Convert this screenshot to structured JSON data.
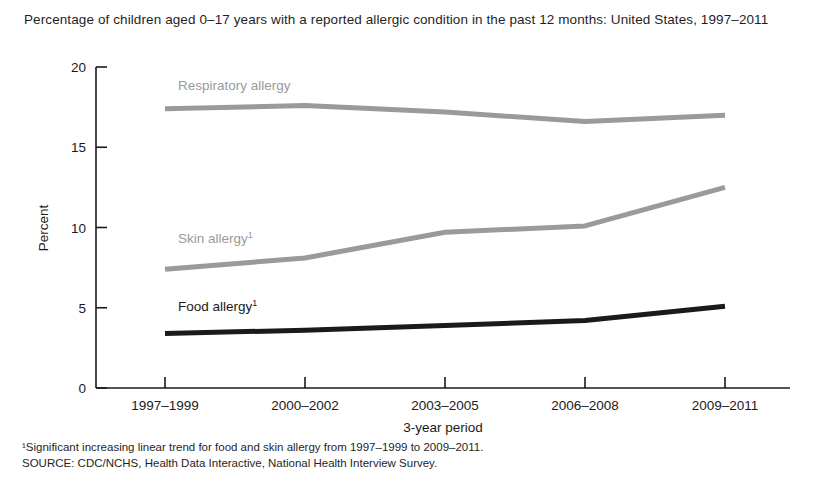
{
  "chart_data": {
    "type": "line",
    "title": "Percentage of children aged 0–17 years with a reported allergic condition in the past 12 months: United States, 1997–2011",
    "xlabel": "3-year period",
    "ylabel": "Percent",
    "categories": [
      "1997–1999",
      "2000–2002",
      "2003–2005",
      "2006–2008",
      "2009–2011"
    ],
    "ylim": [
      0,
      20
    ],
    "yticks": [
      0,
      5,
      10,
      15,
      20
    ],
    "grid": false,
    "legend_position": "inline-labels",
    "series": [
      {
        "name": "Respiratory allergy",
        "label": "Respiratory allergy",
        "footnote_marker": "",
        "color": "#9a9a9a",
        "values": [
          17.4,
          17.6,
          17.2,
          16.6,
          17.0
        ],
        "label_x": 1997,
        "label_y": 18.8
      },
      {
        "name": "Skin allergy",
        "label": "Skin allergy",
        "footnote_marker": "1",
        "color": "#9a9a9a",
        "values": [
          7.4,
          8.1,
          9.7,
          10.1,
          12.5
        ],
        "label_x": 1997,
        "label_y": 9.9
      },
      {
        "name": "Food allergy",
        "label": "Food allergy",
        "footnote_marker": "1",
        "color": "#1a1a1a",
        "values": [
          3.4,
          3.6,
          3.9,
          4.2,
          5.1
        ],
        "label_x": 1997,
        "label_y": 5.8
      }
    ],
    "annotations": [
      "¹Significant increasing linear trend for food and skin allergy from 1997–1999 to 2009–2011.",
      "SOURCE: CDC/NCHS, Health Data Interactive, National Health Interview Survey."
    ]
  },
  "footnotes": {
    "line1": "¹Significant increasing linear trend for food and skin allergy from 1997–1999 to 2009–2011.",
    "line2": "SOURCE: CDC/NCHS, Health Data Interactive, National Health Interview Survey."
  },
  "colors": {
    "axis": "#1a1a1a",
    "gray_series": "#9a9a9a",
    "dark_series": "#1a1a1a",
    "background": "#ffffff"
  }
}
